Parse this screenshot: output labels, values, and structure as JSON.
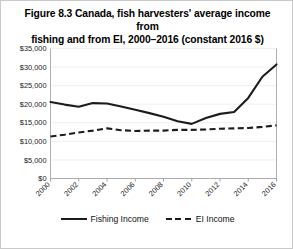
{
  "figure": {
    "title": "Figure 8.3 Canada, fish harvesters' average income from fishing and from EI, 2000–2016 (constant 2016 $)",
    "title_line1": "Figure 8.3 Canada, fish harvesters' average income from",
    "title_line2": "fishing and from EI, 2000–2016 (constant 2016 $)",
    "border_color": "#c9c9c9",
    "series_color": "#1c1c1c",
    "gridline_color": "#e8e8e8"
  },
  "legend": {
    "position": "bottom",
    "items": [
      {
        "label": "Fishing Income",
        "style": "solid",
        "icon": "solid-line-swatch"
      },
      {
        "label": "EI Income",
        "style": "dashed",
        "icon": "dashed-line-swatch"
      }
    ]
  },
  "axes": {
    "y_ticks": [
      "$0",
      "$5,000",
      "$10,000",
      "$15,000",
      "$20,000",
      "$25,000",
      "$30,000",
      "$35,000"
    ],
    "x_ticks": [
      "2000",
      "2002",
      "2004",
      "2006",
      "2008",
      "2010",
      "2012",
      "2014",
      "2016"
    ]
  },
  "chart_data": {
    "type": "line",
    "title": "Figure 8.3 Canada, fish harvesters' average income from fishing and from EI, 2000–2016 (constant 2016 $)",
    "xlabel": "",
    "ylabel": "",
    "x": [
      2000,
      2001,
      2002,
      2003,
      2004,
      2005,
      2006,
      2007,
      2008,
      2009,
      2010,
      2011,
      2012,
      2013,
      2014,
      2015,
      2016
    ],
    "xlim": [
      2000,
      2016
    ],
    "ylim": [
      0,
      35000
    ],
    "ytick_values": [
      0,
      5000,
      10000,
      15000,
      20000,
      25000,
      30000,
      35000
    ],
    "xtick_values": [
      2000,
      2002,
      2004,
      2006,
      2008,
      2010,
      2012,
      2014,
      2016
    ],
    "grid": true,
    "legend_position": "bottom",
    "series": [
      {
        "name": "Fishing Income",
        "style": "solid",
        "values": [
          20600,
          19900,
          19300,
          20300,
          20200,
          19400,
          18500,
          17600,
          16600,
          15400,
          14700,
          16300,
          17400,
          17900,
          21700,
          27400,
          30700
        ]
      },
      {
        "name": "EI Income",
        "style": "dashed",
        "values": [
          11300,
          11800,
          12400,
          12900,
          13500,
          13000,
          12800,
          12900,
          12900,
          13100,
          13100,
          13200,
          13400,
          13500,
          13600,
          13900,
          14300
        ]
      }
    ]
  }
}
